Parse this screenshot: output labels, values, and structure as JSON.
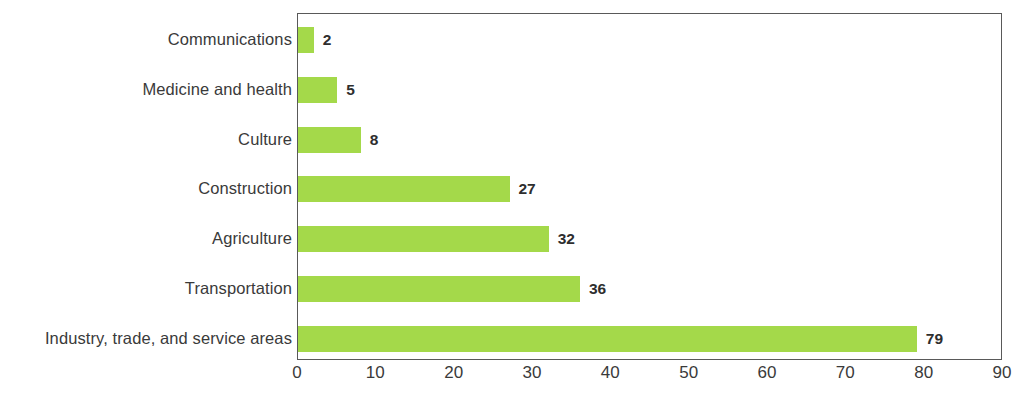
{
  "chart_data": {
    "type": "bar",
    "orientation": "horizontal",
    "title": "",
    "subtitle": "",
    "xlabel": "",
    "ylabel": "",
    "categories": [
      "Communications",
      "Medicine and health",
      "Culture",
      "Construction",
      "Agriculture",
      "Transportation",
      "Industry, trade, and service areas"
    ],
    "values": [
      2,
      5,
      8,
      27,
      32,
      36,
      79
    ],
    "data_labels": [
      "2",
      "5",
      "8",
      "27",
      "32",
      "36",
      "79"
    ],
    "xlim": [
      0,
      90
    ],
    "x_ticks": [
      0,
      10,
      20,
      30,
      40,
      50,
      60,
      70,
      80,
      90
    ],
    "x_tick_labels": [
      "0",
      "10",
      "20",
      "30",
      "40",
      "50",
      "60",
      "70",
      "80",
      "90"
    ],
    "grid": false,
    "legend": false,
    "legend_position": "none",
    "bar_color": "#a4d94a",
    "axis_color": "#595959",
    "label_color": "#3a3a3a",
    "value_label_color": "#2e2e2e",
    "background_color": "#ffffff"
  }
}
